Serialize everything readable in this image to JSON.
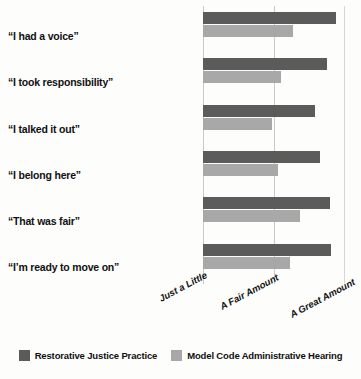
{
  "chart_data": {
    "type": "bar",
    "orientation": "horizontal",
    "title": "",
    "xlabel": "",
    "ylabel": "",
    "grid": true,
    "legend_position": "bottom",
    "categories": [
      "“I had a voice”",
      "“I took responsibility”",
      "“I talked it out”",
      "“I belong here”",
      "“That was fair”",
      "“I’m ready to move on”"
    ],
    "xtick_labels": [
      "Just a Little",
      "A Fair Amount",
      "A Great Amount"
    ],
    "xtick_values": [
      1,
      2,
      3
    ],
    "xlim": [
      1,
      3
    ],
    "series": [
      {
        "name": "Restorative Justice Practice",
        "color": "#5b5b5b",
        "values": [
          2.87,
          2.75,
          2.58,
          2.65,
          2.79,
          2.8
        ]
      },
      {
        "name": "Model Code Administrative Hearing",
        "color": "#a8a8a8",
        "values": [
          2.27,
          2.1,
          1.97,
          2.06,
          2.37,
          2.23
        ]
      }
    ]
  },
  "legend": {
    "entries": [
      {
        "label": "Restorative Justice Practice",
        "color": "#5b5b5b"
      },
      {
        "label": "Model Code Administrative Hearing",
        "color": "#a8a8a8"
      }
    ]
  },
  "colors": {
    "series_a": "#5b5b5b",
    "series_b": "#a8a8a8",
    "gridline": "#c9c9c9",
    "background": "#fdfdfc",
    "text": "#111111"
  }
}
